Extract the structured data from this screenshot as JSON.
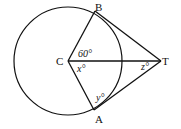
{
  "diagram": {
    "points": {
      "C": {
        "label": "C",
        "x": 68,
        "y": 61
      },
      "B": {
        "label": "B",
        "x": 95,
        "y": 11
      },
      "A": {
        "label": "A",
        "x": 94,
        "y": 110
      },
      "T": {
        "label": "T",
        "x": 161,
        "y": 61
      }
    },
    "circle": {
      "center": "C",
      "radius": 54
    },
    "segments": [
      "CB",
      "CA",
      "CT",
      "BT",
      "AT"
    ],
    "angles": {
      "BCT": "60°",
      "TCA": "x°",
      "CAT": "y°",
      "CTA": "z°"
    }
  }
}
